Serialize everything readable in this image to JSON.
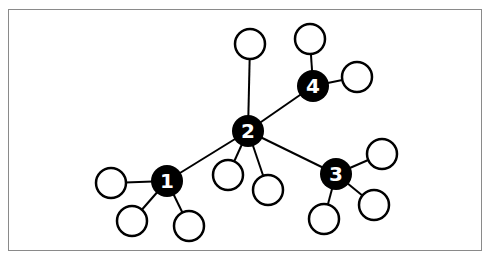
{
  "diagram": {
    "type": "network-graph",
    "frame": {
      "x": 8,
      "y": 9,
      "w": 474,
      "h": 242,
      "border": "#8a8a8a"
    },
    "style": {
      "hub_fill": "#000000",
      "leaf_fill": "#ffffff",
      "stroke": "#000000",
      "label_color": "#ffffff"
    },
    "hubs": [
      {
        "id": "1",
        "label": "1",
        "x": 167,
        "y": 181
      },
      {
        "id": "2",
        "label": "2",
        "x": 248,
        "y": 131
      },
      {
        "id": "3",
        "label": "3",
        "x": 336,
        "y": 174
      },
      {
        "id": "4",
        "label": "4",
        "x": 313,
        "y": 86
      }
    ],
    "leaves": [
      {
        "id": "l2a",
        "x": 250,
        "y": 44,
        "parent": "2"
      },
      {
        "id": "l2b",
        "x": 228,
        "y": 175,
        "parent": "2"
      },
      {
        "id": "l2c",
        "x": 268,
        "y": 190,
        "parent": "2"
      },
      {
        "id": "l4a",
        "x": 310,
        "y": 39,
        "parent": "4"
      },
      {
        "id": "l4b",
        "x": 357,
        "y": 77,
        "parent": "4"
      },
      {
        "id": "l3a",
        "x": 382,
        "y": 154,
        "parent": "3"
      },
      {
        "id": "l3b",
        "x": 374,
        "y": 205,
        "parent": "3"
      },
      {
        "id": "l3c",
        "x": 324,
        "y": 219,
        "parent": "3"
      },
      {
        "id": "l1a",
        "x": 111,
        "y": 183,
        "parent": "1"
      },
      {
        "id": "l1b",
        "x": 132,
        "y": 221,
        "parent": "1"
      },
      {
        "id": "l1c",
        "x": 189,
        "y": 226,
        "parent": "1"
      }
    ],
    "edges": [
      [
        "2",
        "1"
      ],
      [
        "2",
        "3"
      ],
      [
        "2",
        "4"
      ],
      [
        "2",
        "l2a"
      ],
      [
        "2",
        "l2b"
      ],
      [
        "2",
        "l2c"
      ],
      [
        "4",
        "l4a"
      ],
      [
        "4",
        "l4b"
      ],
      [
        "3",
        "l3a"
      ],
      [
        "3",
        "l3b"
      ],
      [
        "3",
        "l3c"
      ],
      [
        "1",
        "l1a"
      ],
      [
        "1",
        "l1b"
      ],
      [
        "1",
        "l1c"
      ]
    ],
    "hub_radius": 16,
    "leaf_radius": 15
  }
}
